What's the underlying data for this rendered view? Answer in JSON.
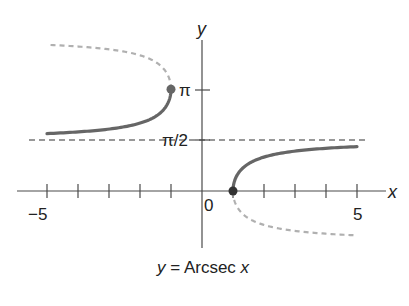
{
  "chart_data": {
    "type": "line",
    "title": "y = Arcsec x",
    "caption": {
      "y_var": "y",
      "equals": "=",
      "func": "Arcsec",
      "x_var": "x"
    },
    "xlabel": "x",
    "ylabel": "y",
    "xlim": [
      -5.5,
      5.8
    ],
    "x_ticks": [
      -5,
      -4,
      -3,
      -2,
      -1,
      1,
      2,
      3,
      4,
      5
    ],
    "x_tick_labels": {
      "neg": "−5",
      "zero": "0",
      "pos": "5"
    },
    "y_ticks": [
      {
        "value": 1.5708,
        "label": "π/2"
      },
      {
        "value": 3.1416,
        "label": "π"
      }
    ],
    "asymptote": {
      "y": 1.5708,
      "label": "π/2",
      "style": "dashed"
    },
    "series": [
      {
        "name": "Arcsec x (x ≤ −1), principal branch",
        "style": "solid",
        "x": [
          -5,
          -4,
          -3,
          -2,
          -1.5,
          -1.2,
          -1
        ],
        "y": [
          1.772,
          1.823,
          1.911,
          2.094,
          2.301,
          2.556,
          3.142
        ]
      },
      {
        "name": "Arcsec x (x ≥ 1), principal branch",
        "style": "solid",
        "x": [
          1,
          1.2,
          1.5,
          2,
          3,
          4,
          5
        ],
        "y": [
          0,
          0.586,
          0.841,
          1.047,
          1.231,
          1.318,
          1.369
        ]
      },
      {
        "name": "arcsec x, non-principal (x ≤ −1)",
        "style": "dashed",
        "x": [
          -5,
          -4,
          -3,
          -2,
          -1.5,
          -1.2,
          -1
        ],
        "y": [
          4.511,
          4.46,
          4.372,
          4.189,
          3.982,
          3.727,
          3.142
        ]
      },
      {
        "name": "arcsec x, non-principal (x ≥ 1)",
        "style": "dashed",
        "x": [
          1,
          1.2,
          1.5,
          2,
          3,
          4,
          5
        ],
        "y": [
          0,
          -0.586,
          -0.841,
          -1.047,
          -1.231,
          -1.318,
          -1.369
        ]
      }
    ],
    "points": [
      {
        "x": -1,
        "y": 3.1416,
        "style": "closed",
        "color": "#666666"
      },
      {
        "x": 1,
        "y": 0,
        "style": "closed",
        "color": "#333333"
      }
    ],
    "grid": false,
    "colors": {
      "solid_curve": "#666666",
      "dashed_curve": "#b0b0b0",
      "axis": "#4a4a4a",
      "asymptote": "#333333"
    }
  }
}
